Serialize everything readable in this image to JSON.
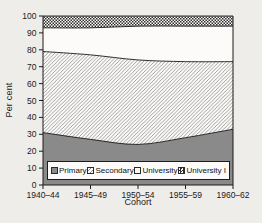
{
  "figure": {
    "ylabel": "Per cent",
    "xlabel": "Cohort"
  },
  "chart_data": {
    "type": "area",
    "stacked": true,
    "title": "",
    "xlabel": "Cohort",
    "ylabel": "Per cent",
    "categories": [
      "1940–44",
      "1945–49",
      "1950–54",
      "1955–59",
      "1960–62"
    ],
    "series": [
      {
        "name": "Primary",
        "pattern": "solid-gray",
        "values": [
          31,
          27,
          24,
          28,
          33
        ]
      },
      {
        "name": "Secondary",
        "pattern": "diagonal-hatch",
        "values": [
          48,
          50,
          50,
          45,
          40
        ]
      },
      {
        "name": "University",
        "pattern": "white",
        "values": [
          14,
          16,
          20,
          21,
          21
        ]
      },
      {
        "name": "University I",
        "pattern": "dots",
        "values": [
          7,
          7,
          6,
          6,
          6
        ]
      }
    ],
    "ylim": [
      0,
      100
    ],
    "yticks": [
      0,
      10,
      20,
      30,
      40,
      50,
      60,
      70,
      80,
      90,
      100
    ],
    "grid": false,
    "legend_position": "bottom-inside"
  },
  "colors": {
    "page_bg": "#efedea",
    "band_white": "#fcfbf9",
    "primary_fill": "#8a8a8a",
    "hatch_line": "#8f8f8f",
    "dot_fill": "#2e2e2e",
    "outline": "#1a1a1a",
    "text": "#1a1a1a"
  }
}
